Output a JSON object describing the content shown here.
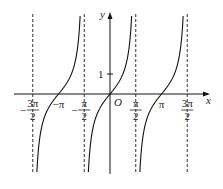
{
  "chart_data": {
    "type": "line",
    "title": "",
    "function": "y = tan x",
    "xlabel": "x",
    "ylabel": "y",
    "origin_label": "O",
    "x_ticks": [
      {
        "value": -4.712,
        "label_num": "3π",
        "label_den": "2",
        "neg": true
      },
      {
        "value": -3.1416,
        "label": "−π"
      },
      {
        "value": -1.5708,
        "label_num": "π",
        "label_den": "2",
        "neg": true
      },
      {
        "value": 1.5708,
        "label_num": "π",
        "label_den": "2",
        "neg": false
      },
      {
        "value": 3.1416,
        "label": "π"
      },
      {
        "value": 4.712,
        "label_num": "3π",
        "label_den": "2",
        "neg": false
      }
    ],
    "y_ticks": [
      {
        "value": 1,
        "label": "1"
      }
    ],
    "asymptotes": [
      -4.712,
      -1.5708,
      1.5708,
      4.712
    ],
    "branches": [
      {
        "x_range": [
          -4.712,
          -1.5708
        ],
        "center": -3.1416
      },
      {
        "x_range": [
          -1.5708,
          1.5708
        ],
        "center": 0
      },
      {
        "x_range": [
          1.5708,
          4.712
        ],
        "center": 3.1416
      }
    ],
    "xlim": [
      -5.8,
      6.0
    ],
    "ylim": [
      -5.8,
      4.1
    ],
    "grid": false,
    "legend": null
  }
}
